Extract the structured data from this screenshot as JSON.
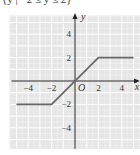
{
  "caption": "{y | −2 ≤ y ≤ 2}",
  "chart_data": {
    "type": "line",
    "title": "",
    "xlabel": "x",
    "ylabel": "y",
    "origin_label": "O",
    "xlim": [
      -5.6,
      5.6
    ],
    "ylim": [
      -5.8,
      5.6
    ],
    "grid": true,
    "x_ticks": [
      -4,
      -2,
      2,
      4
    ],
    "y_ticks": [
      4,
      2,
      -2,
      -4
    ],
    "x_tick_labels": [
      "−4",
      "−2",
      "2",
      "4"
    ],
    "y_tick_labels": [
      "4",
      "2",
      "−2",
      "−4"
    ],
    "series": [
      {
        "name": "f(x)",
        "x": [
          -5,
          -2,
          2,
          5
        ],
        "y": [
          -2,
          -2,
          2,
          2
        ]
      }
    ],
    "colors": {
      "background": "#e6e6e6",
      "grid": "#ffffff",
      "axis": "#222222",
      "line": "#666666"
    }
  }
}
